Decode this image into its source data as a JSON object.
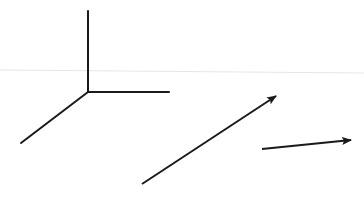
{
  "diagram": {
    "width": 364,
    "height": 197,
    "background": "#ffffff",
    "stroke_color": "#1a1a1a",
    "faint_line_color": "#e6e6e6",
    "faint_line": {
      "x1": 0,
      "y1": 70,
      "x2": 364,
      "y2": 73
    },
    "axes": {
      "origin": {
        "x": 88,
        "y": 92
      },
      "up": {
        "x": 88,
        "y": 11
      },
      "right": {
        "x": 169,
        "y": 92
      },
      "down_left": {
        "x": 21,
        "y": 143
      }
    },
    "arrows": [
      {
        "name": "long-diagonal-arrow",
        "x1": 142,
        "y1": 184,
        "x2": 276,
        "y2": 96
      },
      {
        "name": "short-arrow",
        "x1": 262,
        "y1": 149,
        "x2": 351,
        "y2": 140
      }
    ]
  }
}
